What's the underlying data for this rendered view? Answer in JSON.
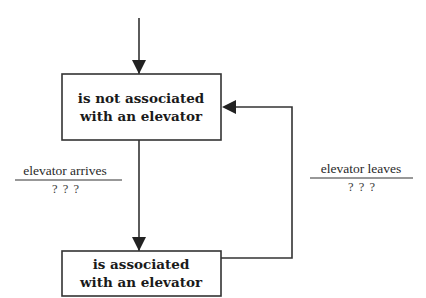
{
  "diagram": {
    "type": "state-diagram",
    "colors": {
      "stroke": "#333333",
      "text": "#1a1a1a",
      "background": "#ffffff"
    },
    "states": [
      {
        "id": "not-associated",
        "line1": "is not associated",
        "line2": "with an elevator"
      },
      {
        "id": "associated",
        "line1": "is associated",
        "line2": "with an elevator"
      }
    ],
    "transitions": [
      {
        "from": "initial",
        "to": "not-associated",
        "event": "",
        "guard": ""
      },
      {
        "from": "not-associated",
        "to": "associated",
        "event": "elevator arrives",
        "guard": "? ? ?"
      },
      {
        "from": "associated",
        "to": "not-associated",
        "event": "elevator leaves",
        "guard": "? ? ?"
      }
    ]
  }
}
